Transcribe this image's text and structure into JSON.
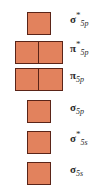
{
  "diagram": {
    "fill_color": "#e2825d",
    "border_color": "#5a2418",
    "background_color": "#ffffff",
    "levels": [
      {
        "symbol": "σ",
        "antibonding_marker": "*",
        "subscript": "5p",
        "label": "σ*5p",
        "box_count": 1,
        "top": 12
      },
      {
        "symbol": "π",
        "antibonding_marker": "*",
        "subscript": "5p",
        "label": "π*5p",
        "box_count": 2,
        "top": 41
      },
      {
        "symbol": "π",
        "antibonding_marker": "",
        "subscript": "5p",
        "label": "π5p",
        "box_count": 2,
        "top": 68
      },
      {
        "symbol": "σ",
        "antibonding_marker": "",
        "subscript": "5p",
        "label": "σ5p",
        "box_count": 1,
        "top": 100
      },
      {
        "symbol": "σ",
        "antibonding_marker": "*",
        "subscript": "5s",
        "label": "σ*5s",
        "box_count": 1,
        "top": 131
      },
      {
        "symbol": "σ",
        "antibonding_marker": "",
        "subscript": "5s",
        "label": "σ5s",
        "box_count": 1,
        "top": 162
      }
    ]
  }
}
